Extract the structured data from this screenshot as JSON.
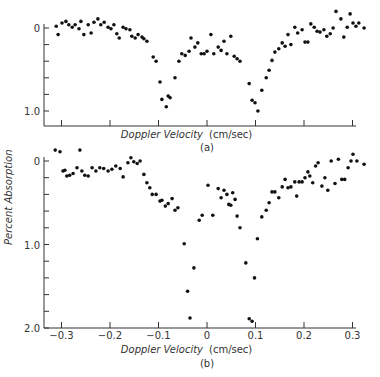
{
  "figure": {
    "ylabel": "Percent Absorption",
    "panel_a": {
      "xlabel_italic": "Doppler Velocity",
      "xlabel_unit": "(cm/sec)",
      "caption": "(a)"
    },
    "panel_b": {
      "xlabel_italic": "Doppler Velocity",
      "xlabel_unit": "(cm/sec)",
      "caption": "(b)"
    }
  },
  "chart_data": [
    {
      "type": "scatter",
      "title": "(a)",
      "xlabel": "Doppler Velocity (cm/sec)",
      "ylabel": "Percent Absorption",
      "xlim": [
        -0.33,
        0.33
      ],
      "ylim": [
        1.18,
        -0.05
      ],
      "y_inverted": true,
      "xticks": [
        -0.3,
        -0.2,
        -0.1,
        0,
        0.1,
        0.2,
        0.3
      ],
      "yticks": [
        0,
        0.2,
        0.4,
        0.6,
        0.8,
        1.0
      ],
      "ytick_labels": [
        "0",
        "",
        "",
        "",
        "",
        "1.0"
      ],
      "xtick_labels": [],
      "grid": false,
      "points": [
        [
          -0.311,
          -0.02
        ],
        [
          -0.307,
          0.08
        ],
        [
          -0.299,
          -0.06
        ],
        [
          -0.291,
          -0.08
        ],
        [
          -0.285,
          -0.04
        ],
        [
          -0.278,
          -0.01
        ],
        [
          -0.272,
          -0.04
        ],
        [
          -0.264,
          0.01
        ],
        [
          -0.26,
          -0.08
        ],
        [
          -0.254,
          0.08
        ],
        [
          -0.245,
          -0.04
        ],
        [
          -0.239,
          0.06
        ],
        [
          -0.233,
          -0.07
        ],
        [
          -0.225,
          -0.11
        ],
        [
          -0.219,
          -0.04
        ],
        [
          -0.212,
          -0.07
        ],
        [
          -0.204,
          -0.01
        ],
        [
          -0.198,
          0.01
        ],
        [
          -0.192,
          -0.04
        ],
        [
          -0.186,
          0.07
        ],
        [
          -0.181,
          0.12
        ],
        [
          -0.173,
          -0.01
        ],
        [
          -0.167,
          0.01
        ],
        [
          -0.159,
          0.02
        ],
        [
          -0.155,
          0.1
        ],
        [
          -0.148,
          0.12
        ],
        [
          -0.142,
          0.08
        ],
        [
          -0.134,
          0.11
        ],
        [
          -0.13,
          0.13
        ],
        [
          -0.124,
          0.16
        ],
        [
          -0.111,
          0.35
        ],
        [
          -0.105,
          0.4
        ],
        [
          -0.097,
          0.65
        ],
        [
          -0.093,
          0.86
        ],
        [
          -0.084,
          0.95
        ],
        [
          -0.08,
          0.82
        ],
        [
          -0.076,
          0.84
        ],
        [
          -0.066,
          0.6
        ],
        [
          -0.058,
          0.4
        ],
        [
          -0.052,
          0.31
        ],
        [
          -0.045,
          0.33
        ],
        [
          -0.037,
          0.28
        ],
        [
          -0.033,
          0.12
        ],
        [
          -0.025,
          0.23
        ],
        [
          -0.019,
          0.18
        ],
        [
          -0.012,
          0.31
        ],
        [
          -0.006,
          0.31
        ],
        [
          0.0,
          0.28
        ],
        [
          0.008,
          0.08
        ],
        [
          0.014,
          0.31
        ],
        [
          0.023,
          0.23
        ],
        [
          0.029,
          0.27
        ],
        [
          0.035,
          0.16
        ],
        [
          0.041,
          0.31
        ],
        [
          0.049,
          0.1
        ],
        [
          0.056,
          0.34
        ],
        [
          0.062,
          0.37
        ],
        [
          0.068,
          0.4
        ],
        [
          0.087,
          0.67
        ],
        [
          0.093,
          0.87
        ],
        [
          0.099,
          0.9
        ],
        [
          0.105,
          1.0
        ],
        [
          0.113,
          0.75
        ],
        [
          0.122,
          0.6
        ],
        [
          0.128,
          0.51
        ],
        [
          0.134,
          0.39
        ],
        [
          0.14,
          0.29
        ],
        [
          0.148,
          0.25
        ],
        [
          0.155,
          0.18
        ],
        [
          0.161,
          0.22
        ],
        [
          0.167,
          0.08
        ],
        [
          0.173,
          0.2
        ],
        [
          0.181,
          -0.01
        ],
        [
          0.187,
          0.06
        ],
        [
          0.196,
          0.02
        ],
        [
          0.202,
          0.17
        ],
        [
          0.208,
          0.17
        ],
        [
          0.214,
          -0.05
        ],
        [
          0.221,
          -0.01
        ],
        [
          0.227,
          0.04
        ],
        [
          0.233,
          0.05
        ],
        [
          0.241,
          0.02
        ],
        [
          0.247,
          0.1
        ],
        [
          0.254,
          0.07
        ],
        [
          0.26,
          0.0
        ],
        [
          0.266,
          -0.2
        ],
        [
          0.276,
          -0.11
        ],
        [
          0.282,
          0.11
        ],
        [
          0.289,
          -0.01
        ],
        [
          0.295,
          -0.17
        ],
        [
          0.301,
          -0.06
        ],
        [
          0.307,
          -0.02
        ],
        [
          0.313,
          -0.06
        ],
        [
          0.324,
          0.0
        ]
      ]
    },
    {
      "type": "scatter",
      "title": "(b)",
      "xlabel": "Doppler Velocity (cm/sec)",
      "ylabel": "Percent Absorption",
      "xlim": [
        -0.33,
        0.33
      ],
      "ylim": [
        2.0,
        -0.2
      ],
      "y_inverted": true,
      "xticks": [
        -0.3,
        -0.2,
        -0.1,
        0,
        0.1,
        0.2,
        0.3
      ],
      "xtick_labels": [
        "-0.3",
        "-0.2",
        "-0.1",
        "0",
        "0.1",
        "0.2",
        "0.3"
      ],
      "yticks": [
        0,
        0.2,
        0.4,
        0.6,
        0.8,
        1.0,
        1.2,
        1.4,
        1.6,
        1.8,
        2.0
      ],
      "ytick_labels": [
        "0",
        "",
        "",
        "",
        "",
        "1.0",
        "",
        "",
        "",
        "",
        "2.0"
      ],
      "grid": false,
      "points": [
        [
          -0.313,
          -0.13
        ],
        [
          -0.303,
          -0.11
        ],
        [
          -0.297,
          0.12
        ],
        [
          -0.293,
          0.11
        ],
        [
          -0.289,
          0.18
        ],
        [
          -0.283,
          0.17
        ],
        [
          -0.276,
          0.15
        ],
        [
          -0.268,
          0.08
        ],
        [
          -0.262,
          -0.13
        ],
        [
          -0.258,
          0.12
        ],
        [
          -0.252,
          0.17
        ],
        [
          -0.245,
          0.18
        ],
        [
          -0.237,
          0.08
        ],
        [
          -0.229,
          0.12
        ],
        [
          -0.221,
          0.08
        ],
        [
          -0.213,
          0.09
        ],
        [
          -0.204,
          0.12
        ],
        [
          -0.196,
          0.1
        ],
        [
          -0.188,
          0.06
        ],
        [
          -0.179,
          0.09
        ],
        [
          -0.173,
          0.19
        ],
        [
          -0.163,
          0.02
        ],
        [
          -0.157,
          -0.04
        ],
        [
          -0.151,
          0.01
        ],
        [
          -0.144,
          0.03
        ],
        [
          -0.138,
          0.0
        ],
        [
          -0.13,
          0.16
        ],
        [
          -0.124,
          0.26
        ],
        [
          -0.118,
          0.32
        ],
        [
          -0.113,
          0.4
        ],
        [
          -0.105,
          0.4
        ],
        [
          -0.097,
          0.48
        ],
        [
          -0.093,
          0.47
        ],
        [
          -0.086,
          0.54
        ],
        [
          -0.08,
          0.51
        ],
        [
          -0.072,
          0.45
        ],
        [
          -0.066,
          0.59
        ],
        [
          -0.06,
          0.56
        ],
        [
          -0.047,
          0.99
        ],
        [
          -0.04,
          1.56
        ],
        [
          -0.035,
          1.88
        ],
        [
          -0.027,
          1.28
        ],
        [
          -0.016,
          0.71
        ],
        [
          -0.01,
          0.65
        ],
        [
          0.002,
          0.29
        ],
        [
          0.012,
          0.65
        ],
        [
          0.023,
          0.33
        ],
        [
          0.029,
          0.44
        ],
        [
          0.035,
          0.35
        ],
        [
          0.041,
          0.4
        ],
        [
          0.045,
          0.52
        ],
        [
          0.049,
          0.53
        ],
        [
          0.053,
          0.38
        ],
        [
          0.058,
          0.46
        ],
        [
          0.062,
          0.66
        ],
        [
          0.068,
          0.8
        ],
        [
          0.08,
          1.22
        ],
        [
          0.087,
          1.89
        ],
        [
          0.093,
          1.92
        ],
        [
          0.098,
          1.4
        ],
        [
          0.104,
          0.93
        ],
        [
          0.113,
          0.67
        ],
        [
          0.122,
          0.59
        ],
        [
          0.128,
          0.5
        ],
        [
          0.134,
          0.37
        ],
        [
          0.14,
          0.37
        ],
        [
          0.148,
          0.44
        ],
        [
          0.155,
          0.31
        ],
        [
          0.161,
          0.22
        ],
        [
          0.167,
          0.32
        ],
        [
          0.173,
          0.31
        ],
        [
          0.181,
          0.25
        ],
        [
          0.185,
          0.42
        ],
        [
          0.19,
          0.25
        ],
        [
          0.196,
          0.25
        ],
        [
          0.202,
          0.2
        ],
        [
          0.208,
          0.13
        ],
        [
          0.212,
          0.18
        ],
        [
          0.218,
          0.26
        ],
        [
          0.224,
          0.06
        ],
        [
          0.229,
          0.02
        ],
        [
          0.237,
          0.3
        ],
        [
          0.243,
          0.2
        ],
        [
          0.249,
          0.35
        ],
        [
          0.256,
          0.0
        ],
        [
          0.264,
          0.27
        ],
        [
          0.271,
          -0.02
        ],
        [
          0.278,
          0.22
        ],
        [
          0.284,
          0.22
        ],
        [
          0.291,
          0.08
        ],
        [
          0.297,
          0.0
        ],
        [
          0.301,
          -0.08
        ],
        [
          0.309,
          0.0
        ],
        [
          0.324,
          0.04
        ]
      ]
    }
  ]
}
